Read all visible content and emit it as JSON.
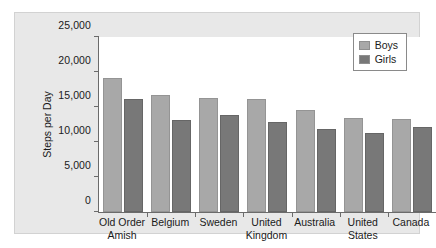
{
  "chart_data": {
    "type": "bar",
    "title": "",
    "xlabel": "",
    "ylabel": "Steps per Day",
    "ylim": [
      0,
      25000
    ],
    "yticks": [
      "0",
      "5,000",
      "10,000",
      "15,000",
      "20,000",
      "25,000"
    ],
    "ytick_values": [
      0,
      5000,
      10000,
      15000,
      20000,
      25000
    ],
    "grid": false,
    "legend_position": "top-right",
    "categories": [
      "Old Order Amish",
      "Belgium",
      "Sweden",
      "United Kingdom",
      "Australia",
      "United States",
      "Canada"
    ],
    "category_lines": [
      [
        "Old Order",
        "Amish"
      ],
      [
        "Belgium"
      ],
      [
        "Sweden"
      ],
      [
        "United",
        "Kingdom"
      ],
      [
        "Australia"
      ],
      [
        "United",
        "States"
      ],
      [
        "Canada"
      ]
    ],
    "series": [
      {
        "name": "Boys",
        "color": "#a8a8a8",
        "values": [
          19100,
          16700,
          16300,
          16200,
          14600,
          13500,
          13300
        ]
      },
      {
        "name": "Girls",
        "color": "#787878",
        "values": [
          16100,
          13100,
          13800,
          12900,
          11900,
          11300,
          12100
        ]
      }
    ]
  },
  "legend": {
    "entries": [
      {
        "label": "Boys"
      },
      {
        "label": "Girls"
      }
    ]
  }
}
